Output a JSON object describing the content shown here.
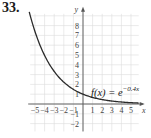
{
  "problem": {
    "number": "33."
  },
  "chart_data": {
    "type": "line",
    "title": "",
    "function_label": "f(x) = e^{-0.4x}",
    "function_label_parts": {
      "lhs": "f(x) = e",
      "exponent": "−0.4x"
    },
    "xlabel": "x",
    "ylabel": "y",
    "xlim": [
      -5.5,
      5.8
    ],
    "ylim": [
      -2.8,
      9.2
    ],
    "x_ticks": [
      -5,
      -4,
      -3,
      -2,
      -1,
      1,
      2,
      3,
      4,
      5
    ],
    "x_tick_labels": [
      "−5",
      "−4",
      "−3",
      "−2",
      "−1",
      "1",
      "2",
      "3",
      "4",
      "5"
    ],
    "y_ticks": [
      -2,
      -1,
      1,
      2,
      3,
      4,
      5,
      6,
      7,
      8
    ],
    "y_tick_labels": [
      "−2",
      "−1",
      "1",
      "2",
      "3",
      "4",
      "5",
      "6",
      "7",
      "8"
    ],
    "grid": true,
    "series": [
      {
        "name": "f(x) = e^{-0.4x}",
        "x": [
          -5.5,
          -5,
          -4,
          -3,
          -2,
          -1,
          0,
          1,
          2,
          3,
          4,
          5,
          5.8
        ],
        "y": [
          9.03,
          7.39,
          4.95,
          3.32,
          2.23,
          1.49,
          1.0,
          0.67,
          0.45,
          0.3,
          0.2,
          0.14,
          0.1
        ]
      }
    ]
  }
}
